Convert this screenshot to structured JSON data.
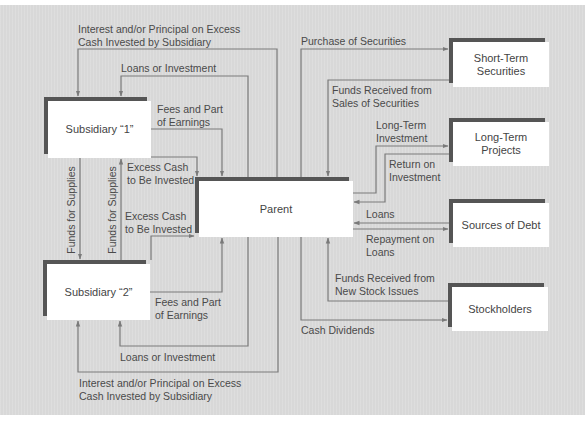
{
  "diagram": {
    "nodes": {
      "subsidiary1": {
        "label": "Subsidiary “1”"
      },
      "subsidiary2": {
        "label": "Subsidiary “2”"
      },
      "parent": {
        "label": "Parent"
      },
      "short_term_securities": {
        "lines": [
          "Short-Term",
          "Securities"
        ]
      },
      "long_term_projects": {
        "lines": [
          "Long-Term",
          "Projects"
        ]
      },
      "sources_of_debt": {
        "label": "Sources of Debt"
      },
      "stockholders": {
        "label": "Stockholders"
      }
    },
    "flows": {
      "interest_top": {
        "lines": [
          "Interest and/or Principal on Excess",
          "Cash Invested by Subsidiary"
        ],
        "from": "Parent",
        "to": "Subsidiary 1"
      },
      "loans_top": {
        "lines": [
          "Loans or Investment"
        ],
        "from": "Parent",
        "to": "Subsidiary 1"
      },
      "fees_top": {
        "lines": [
          "Fees and Part",
          "of Earnings"
        ],
        "from": "Subsidiary 1",
        "to": "Parent"
      },
      "funds_supplies_down": {
        "label": "Funds for Supplies",
        "from": "Subsidiary 1",
        "to": "Subsidiary 2"
      },
      "funds_supplies_up": {
        "label": "Funds for Supplies",
        "from": "Subsidiary 2",
        "to": "Subsidiary 1"
      },
      "excess_cash_1": {
        "lines": [
          "Excess Cash",
          "to Be Invested"
        ],
        "from": "Subsidiary 1",
        "to": "Parent"
      },
      "excess_cash_2": {
        "lines": [
          "Excess Cash",
          "to Be Invested"
        ],
        "from": "Subsidiary 2",
        "to": "Parent"
      },
      "fees_bottom": {
        "lines": [
          "Fees and Part",
          "of Earnings"
        ],
        "from": "Subsidiary 2",
        "to": "Parent"
      },
      "loans_bottom": {
        "lines": [
          "Loans or Investment"
        ],
        "from": "Parent",
        "to": "Subsidiary 2"
      },
      "interest_bottom": {
        "lines": [
          "Interest and/or Principal on Excess",
          "Cash Invested by Subsidiary"
        ],
        "from": "Parent",
        "to": "Subsidiary 2"
      },
      "purchase_securities": {
        "lines": [
          "Purchase of Securities"
        ],
        "from": "Parent",
        "to": "Short-Term Securities"
      },
      "funds_from_sales": {
        "lines": [
          "Funds Received from",
          "Sales of Securities"
        ],
        "from": "Short-Term Securities",
        "to": "Parent"
      },
      "long_term_investment": {
        "lines": [
          "Long-Term",
          "Investment"
        ],
        "from": "Parent",
        "to": "Long-Term Projects"
      },
      "return_on_investment": {
        "lines": [
          "Return on",
          "Investment"
        ],
        "from": "Long-Term Projects",
        "to": "Parent"
      },
      "loans_right": {
        "lines": [
          "Loans"
        ],
        "from": "Sources of Debt",
        "to": "Parent"
      },
      "repayment_on_loans": {
        "lines": [
          "Repayment on",
          "Loans"
        ],
        "from": "Parent",
        "to": "Sources of Debt"
      },
      "funds_new_stock": {
        "lines": [
          "Funds Received from",
          "New Stock Issues"
        ],
        "from": "Stockholders",
        "to": "Parent"
      },
      "cash_dividends": {
        "lines": [
          "Cash Dividends"
        ],
        "from": "Parent",
        "to": "Stockholders"
      }
    },
    "colors": {
      "background": "#dcdcdc",
      "box_shadow": "#555555",
      "box_face": "#ffffff",
      "line": "#7a7a7a",
      "text": "#4a4a4a"
    }
  }
}
